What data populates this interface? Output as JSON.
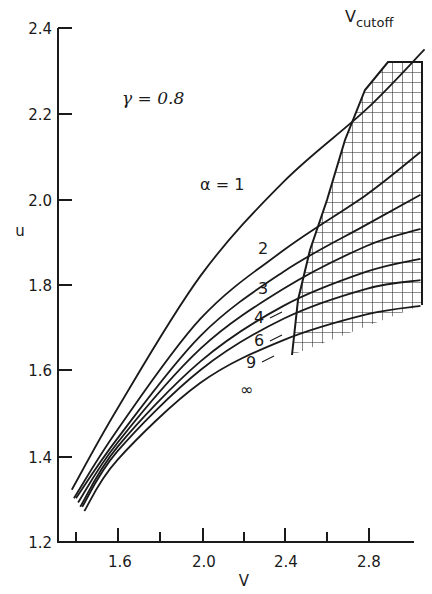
{
  "chart_data": {
    "type": "line",
    "title": "",
    "xlabel": "V",
    "ylabel": "u",
    "xlim": [
      1.31,
      3.08
    ],
    "ylim": [
      1.2,
      2.4
    ],
    "xticks_major": [
      "1.6",
      "2.0",
      "2.4",
      "2.8"
    ],
    "xticks_minor": [
      1.4,
      1.8,
      2.2,
      2.6
    ],
    "yticks": [
      "1.2",
      "1.4",
      "1.6",
      "1.8",
      "2.0",
      "2.2",
      "2.4"
    ],
    "grid": false,
    "parameter_annotation": "γ = 0.8",
    "cutoff_label": "V",
    "cutoff_subscript": "cutoff",
    "series": [
      {
        "name": "α = 1",
        "label": "α = 1",
        "x": [
          1.38,
          1.6,
          2.0,
          2.4,
          2.8,
          3.08
        ],
        "y": [
          1.32,
          1.51,
          1.82,
          2.04,
          2.21,
          2.35
        ]
      },
      {
        "name": "α = 2",
        "label": "2",
        "x": [
          1.39,
          1.6,
          2.0,
          2.4,
          2.8,
          3.06
        ],
        "y": [
          1.3,
          1.46,
          1.72,
          1.88,
          2.01,
          2.11
        ]
      },
      {
        "name": "α = 3",
        "label": "3",
        "x": [
          1.4,
          1.6,
          2.0,
          2.4,
          2.8,
          3.06
        ],
        "y": [
          1.3,
          1.44,
          1.68,
          1.83,
          1.94,
          2.01
        ]
      },
      {
        "name": "α = 4",
        "label": "4",
        "x": [
          1.41,
          1.6,
          2.0,
          2.4,
          2.8,
          3.06
        ],
        "y": [
          1.29,
          1.43,
          1.65,
          1.79,
          1.89,
          1.93
        ]
      },
      {
        "name": "α = 6",
        "label": "6",
        "x": [
          1.42,
          1.6,
          2.0,
          2.4,
          2.8,
          3.06
        ],
        "y": [
          1.28,
          1.42,
          1.62,
          1.75,
          1.83,
          1.86
        ]
      },
      {
        "name": "α = 9",
        "label": "9",
        "x": [
          1.43,
          1.6,
          2.0,
          2.4,
          2.8,
          3.06
        ],
        "y": [
          1.28,
          1.41,
          1.6,
          1.72,
          1.79,
          1.81
        ]
      },
      {
        "name": "α = ∞",
        "label": "∞",
        "x": [
          1.44,
          1.6,
          2.0,
          2.4,
          2.8,
          3.06
        ],
        "y": [
          1.27,
          1.39,
          1.57,
          1.67,
          1.73,
          1.75
        ]
      }
    ],
    "cutoff_curve": {
      "x": [
        2.44,
        2.48,
        2.57,
        2.69,
        2.79,
        2.9
      ],
      "u": [
        1.63,
        1.79,
        1.97,
        2.16,
        2.28,
        2.32
      ]
    },
    "shaded_region": "cross-hatched region right of V_cutoff (V ≈ 2.44–3.06)"
  }
}
